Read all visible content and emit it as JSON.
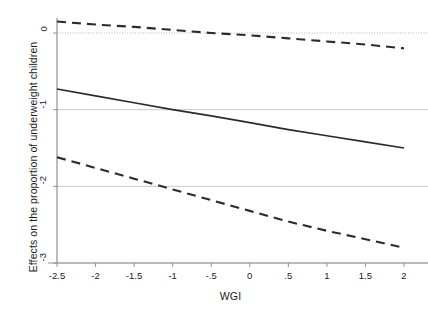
{
  "chart_data": {
    "type": "line",
    "title": "",
    "xlabel": "WGI",
    "ylabel": "Effects on the proportion of underweight children",
    "xlim": [
      -2.5,
      2
    ],
    "ylim": [
      -3,
      0.2
    ],
    "xticks": [
      "-2.5",
      "-2",
      "-1.5",
      "-1",
      "-.5",
      "0",
      ".5",
      "1",
      "1.5",
      "2"
    ],
    "xtick_values": [
      -2.5,
      -2,
      -1.5,
      -1,
      -0.5,
      0,
      0.5,
      1,
      1.5,
      2
    ],
    "yticks": [
      "0",
      "-1",
      "-2",
      "-3"
    ],
    "ytick_values": [
      0,
      -1,
      -2,
      -3
    ],
    "grid": "horizontal",
    "legend_position": "none",
    "zero_reference_line": {
      "value": 0,
      "style": "dotted",
      "color": "#b4b4b4"
    },
    "gridline_color": "#c8c8c8",
    "axis_color": "#909090",
    "series": [
      {
        "name": "Upper confidence bound",
        "style": "dashed",
        "color": "#2b2b2b",
        "x": [
          -2.5,
          -2,
          -1.5,
          -1,
          -0.5,
          0,
          0.5,
          1,
          1.5,
          2
        ],
        "values": [
          0.15,
          0.11,
          0.08,
          0.04,
          0.0,
          -0.03,
          -0.07,
          -0.11,
          -0.15,
          -0.2
        ]
      },
      {
        "name": "Marginal effect",
        "style": "solid",
        "color": "#2b2b2b",
        "x": [
          -2.5,
          -2,
          -1.5,
          -1,
          -0.5,
          0,
          0.5,
          1,
          1.5,
          2
        ],
        "values": [
          -0.73,
          -0.82,
          -0.91,
          -1.0,
          -1.08,
          -1.17,
          -1.26,
          -1.34,
          -1.42,
          -1.5
        ]
      },
      {
        "name": "Lower confidence bound",
        "style": "dashed",
        "color": "#2b2b2b",
        "x": [
          -2.5,
          -2,
          -1.5,
          -1,
          -0.5,
          0,
          0.5,
          1,
          1.5,
          2
        ],
        "values": [
          -1.62,
          -1.76,
          -1.9,
          -2.04,
          -2.18,
          -2.32,
          -2.46,
          -2.58,
          -2.69,
          -2.8
        ]
      }
    ]
  }
}
